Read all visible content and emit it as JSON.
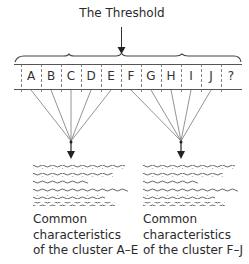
{
  "title": "The Threshold",
  "cells": [
    "A",
    "B",
    "C",
    "D",
    "E",
    "F",
    "G",
    "H",
    "I",
    "J",
    "?"
  ],
  "clusters": [
    {
      "members": "A–E",
      "caption_lines": [
        "Common",
        "characteristics",
        "of the cluster A–E"
      ]
    },
    {
      "members": "F–J",
      "caption_lines": [
        "Common",
        "characteristics",
        "of the cluster F–J"
      ]
    }
  ],
  "colors": {
    "line": "#555555",
    "text": "#2a2a2a"
  }
}
